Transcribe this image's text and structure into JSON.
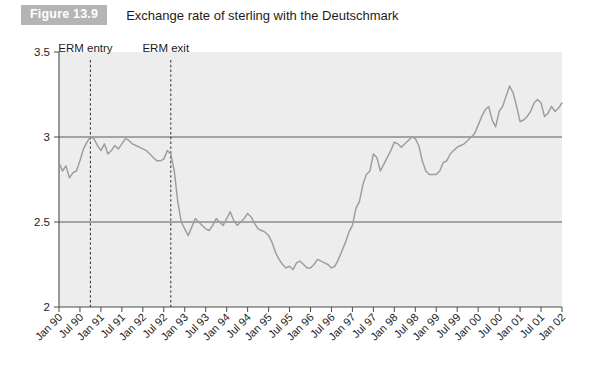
{
  "figure": {
    "badge": "Figure 13.9",
    "title": "Exchange rate of sterling with the Deutschmark"
  },
  "annotations": [
    {
      "label": "ERM entry",
      "x_value": "Oct 90"
    },
    {
      "label": "ERM exit",
      "x_value": "Sep 92"
    }
  ],
  "colors": {
    "series": "#9d9d9d",
    "plot_background": "#ededed",
    "axis": "#4a4a4a",
    "badge_background": "#b4b4b4",
    "badge_text": "#ffffff",
    "text": "#1d1d1d"
  },
  "chart_data": {
    "type": "line",
    "title": "Exchange rate of sterling with the Deutschmark",
    "xlabel": "",
    "ylabel": "",
    "ylim": [
      2,
      3.5
    ],
    "yticks": [
      "2",
      "2.5",
      "3",
      "3.5"
    ],
    "ytick_values": [
      2,
      2.5,
      3,
      3.5
    ],
    "gridlines": [
      2.5,
      3
    ],
    "grid": false,
    "legend": "none",
    "xticks": [
      "Jan 90",
      "Jul 90",
      "Jan 91",
      "Jul 91",
      "Jan 92",
      "Jul 92",
      "Jan 93",
      "Jul 93",
      "Jan 94",
      "Jul 94",
      "Jan 95",
      "Jul 95",
      "Jan 96",
      "Jul 96",
      "Jan 97",
      "Jul 97",
      "Jan 98",
      "Jul 98",
      "Jan 99",
      "Jul 99",
      "Jan 00",
      "Jul 00",
      "Jan 01",
      "Jul 01",
      "Jan 02"
    ],
    "series": [
      {
        "name": "DM per GBP",
        "x": [
          "Jan 90",
          "Feb 90",
          "Mar 90",
          "Apr 90",
          "May 90",
          "Jun 90",
          "Jul 90",
          "Aug 90",
          "Sep 90",
          "Oct 90",
          "Nov 90",
          "Dec 90",
          "Jan 91",
          "Feb 91",
          "Mar 91",
          "Apr 91",
          "May 91",
          "Jun 91",
          "Jul 91",
          "Aug 91",
          "Sep 91",
          "Oct 91",
          "Nov 91",
          "Dec 91",
          "Jan 92",
          "Feb 92",
          "Mar 92",
          "Apr 92",
          "May 92",
          "Jun 92",
          "Jul 92",
          "Aug 92",
          "Sep 92",
          "Oct 92",
          "Nov 92",
          "Dec 92",
          "Jan 93",
          "Feb 93",
          "Mar 93",
          "Apr 93",
          "May 93",
          "Jun 93",
          "Jul 93",
          "Aug 93",
          "Sep 93",
          "Oct 93",
          "Nov 93",
          "Dec 93",
          "Jan 94",
          "Feb 94",
          "Mar 94",
          "Apr 94",
          "May 94",
          "Jun 94",
          "Jul 94",
          "Aug 94",
          "Sep 94",
          "Oct 94",
          "Nov 94",
          "Dec 94",
          "Jan 95",
          "Feb 95",
          "Mar 95",
          "Apr 95",
          "May 95",
          "Jun 95",
          "Jul 95",
          "Aug 95",
          "Sep 95",
          "Oct 95",
          "Nov 95",
          "Dec 95",
          "Jan 96",
          "Feb 96",
          "Mar 96",
          "Apr 96",
          "May 96",
          "Jun 96",
          "Jul 96",
          "Aug 96",
          "Sep 96",
          "Oct 96",
          "Nov 96",
          "Dec 96",
          "Jan 97",
          "Feb 97",
          "Mar 97",
          "Apr 97",
          "May 97",
          "Jun 97",
          "Jul 97",
          "Aug 97",
          "Sep 97",
          "Oct 97",
          "Nov 97",
          "Dec 97",
          "Jan 98",
          "Feb 98",
          "Mar 98",
          "Apr 98",
          "May 98",
          "Jun 98",
          "Jul 98",
          "Aug 98",
          "Sep 98",
          "Oct 98",
          "Nov 98",
          "Dec 98",
          "Jan 99",
          "Feb 99",
          "Mar 99",
          "Apr 99",
          "May 99",
          "Jun 99",
          "Jul 99",
          "Aug 99",
          "Sep 99",
          "Oct 99",
          "Nov 99",
          "Dec 99",
          "Jan 00",
          "Feb 00",
          "Mar 00",
          "Apr 00",
          "May 00",
          "Jun 00",
          "Jul 00",
          "Aug 00",
          "Sep 00",
          "Oct 00",
          "Nov 00",
          "Dec 00",
          "Jan 01",
          "Feb 01",
          "Mar 01",
          "Apr 01",
          "May 01",
          "Jun 01",
          "Jul 01",
          "Aug 01",
          "Sep 01",
          "Oct 01",
          "Nov 01",
          "Dec 01",
          "Jan 02"
        ],
        "values": [
          2.85,
          2.8,
          2.83,
          2.76,
          2.79,
          2.8,
          2.86,
          2.93,
          2.97,
          3.0,
          2.99,
          2.95,
          2.92,
          2.96,
          2.9,
          2.92,
          2.95,
          2.93,
          2.96,
          2.99,
          2.98,
          2.96,
          2.95,
          2.94,
          2.93,
          2.92,
          2.9,
          2.88,
          2.86,
          2.86,
          2.87,
          2.92,
          2.9,
          2.8,
          2.62,
          2.5,
          2.46,
          2.42,
          2.47,
          2.52,
          2.5,
          2.48,
          2.46,
          2.45,
          2.48,
          2.52,
          2.5,
          2.48,
          2.52,
          2.56,
          2.51,
          2.48,
          2.5,
          2.52,
          2.55,
          2.53,
          2.49,
          2.46,
          2.45,
          2.44,
          2.42,
          2.38,
          2.32,
          2.28,
          2.25,
          2.23,
          2.24,
          2.22,
          2.26,
          2.27,
          2.25,
          2.23,
          2.23,
          2.25,
          2.28,
          2.27,
          2.26,
          2.25,
          2.23,
          2.24,
          2.28,
          2.33,
          2.38,
          2.44,
          2.48,
          2.58,
          2.62,
          2.72,
          2.78,
          2.8,
          2.9,
          2.88,
          2.8,
          2.84,
          2.88,
          2.92,
          2.97,
          2.96,
          2.94,
          2.96,
          2.98,
          3.0,
          2.99,
          2.95,
          2.86,
          2.8,
          2.78,
          2.78,
          2.78,
          2.8,
          2.85,
          2.86,
          2.9,
          2.92,
          2.94,
          2.95,
          2.96,
          2.98,
          3.0,
          3.02,
          3.07,
          3.12,
          3.16,
          3.18,
          3.1,
          3.06,
          3.15,
          3.18,
          3.24,
          3.3,
          3.26,
          3.18,
          3.09,
          3.1,
          3.12,
          3.15,
          3.2,
          3.22,
          3.2,
          3.12,
          3.14,
          3.18,
          3.15,
          3.17,
          3.2
        ]
      }
    ]
  }
}
